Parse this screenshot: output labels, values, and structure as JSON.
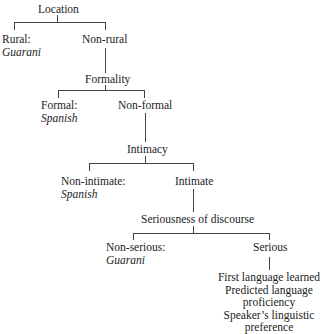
{
  "diagram": {
    "type": "decision-tree",
    "nodes": {
      "location": {
        "label": "Location"
      },
      "rural": {
        "label": "Rural:",
        "outcome": "Guarani"
      },
      "non_rural": {
        "label": "Non-rural"
      },
      "formality": {
        "label": "Formality"
      },
      "formal": {
        "label": "Formal:",
        "outcome": "Spanish"
      },
      "non_formal": {
        "label": "Non-formal"
      },
      "intimacy": {
        "label": "Intimacy"
      },
      "non_intimate": {
        "label": "Non-intimate:",
        "outcome": "Spanish"
      },
      "intimate": {
        "label": "Intimate"
      },
      "seriousness": {
        "label": "Seriousness of discourse"
      },
      "non_serious": {
        "label": "Non-serious:",
        "outcome": "Guarani"
      },
      "serious": {
        "label": "Serious"
      },
      "final_factors": [
        "First language learned",
        "Predicted language proficiency",
        "Speaker’s linguistic preference"
      ]
    },
    "edges": [
      [
        "location",
        "rural"
      ],
      [
        "location",
        "non_rural"
      ],
      [
        "non_rural",
        "formality"
      ],
      [
        "formality",
        "formal"
      ],
      [
        "formality",
        "non_formal"
      ],
      [
        "non_formal",
        "intimacy"
      ],
      [
        "intimacy",
        "non_intimate"
      ],
      [
        "intimacy",
        "intimate"
      ],
      [
        "intimate",
        "seriousness"
      ],
      [
        "seriousness",
        "non_serious"
      ],
      [
        "seriousness",
        "serious"
      ],
      [
        "serious",
        "final_factors"
      ]
    ]
  }
}
